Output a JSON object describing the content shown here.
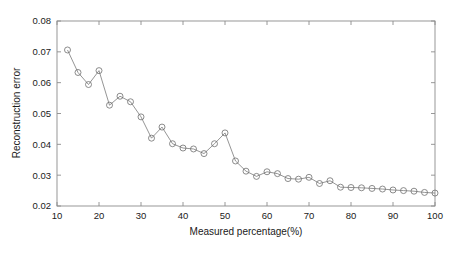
{
  "chart_data": {
    "type": "line",
    "title": "",
    "subtitle": "",
    "xlabel": "Measured percentage(%)",
    "ylabel": "Reconstruction error",
    "xlim": [
      10,
      100
    ],
    "ylim": [
      0.02,
      0.08
    ],
    "xticks": [
      10,
      20,
      30,
      40,
      50,
      60,
      70,
      80,
      90,
      100
    ],
    "xtick_labels": [
      "10",
      "20",
      "30",
      "40",
      "50",
      "60",
      "70",
      "80",
      "90",
      "100"
    ],
    "yticks": [
      0.02,
      0.03,
      0.04,
      0.05,
      0.06,
      0.07,
      0.08
    ],
    "ytick_labels": [
      "0.02",
      "0.03",
      "0.04",
      "0.05",
      "0.06",
      "0.07",
      "0.08"
    ],
    "grid": false,
    "legend": null,
    "legend_position": "none",
    "marker": "circle-open",
    "line_color": "#7a7a7a",
    "marker_color": "#6e6e6e",
    "axis_color": "#8c8c8c",
    "series": [
      {
        "name": "Reconstruction error",
        "x": [
          12.5,
          15,
          17.5,
          20,
          22.5,
          25,
          27.5,
          30,
          32.5,
          35,
          37.5,
          40,
          42.5,
          45,
          47.5,
          50,
          52.5,
          55,
          57.5,
          60,
          62.5,
          65,
          67.5,
          70,
          72.5,
          75,
          77.5,
          80,
          82.5,
          85,
          87.5,
          90,
          92.5,
          95,
          97.5,
          100
        ],
        "y": [
          0.0706,
          0.0633,
          0.0594,
          0.0639,
          0.0527,
          0.0556,
          0.0538,
          0.0489,
          0.042,
          0.0456,
          0.0402,
          0.0388,
          0.0385,
          0.037,
          0.0402,
          0.0437,
          0.0346,
          0.0313,
          0.0296,
          0.0311,
          0.0305,
          0.0289,
          0.0287,
          0.0293,
          0.0273,
          0.0282,
          0.0261,
          0.026,
          0.0259,
          0.0257,
          0.0255,
          0.0252,
          0.025,
          0.0248,
          0.0244,
          0.0242
        ]
      }
    ]
  }
}
